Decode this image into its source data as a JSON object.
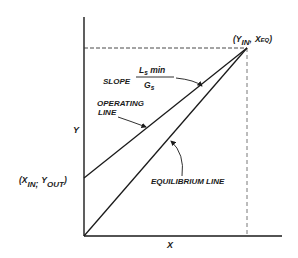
{
  "diagram": {
    "axes": {
      "x_label": "X",
      "y_label": "Y"
    },
    "points": {
      "top": {
        "open": "(Y",
        "sub1": "IN",
        "sep": ",",
        "x": "X",
        "sub2": "EQ",
        "close": ")"
      },
      "left": {
        "open": "(X",
        "sub1": "IN",
        "sep": ";",
        "y": "Y",
        "sub2": "OUT",
        "close": ")"
      }
    },
    "annotations": {
      "slope_prefix": "SLOPE",
      "slope_num_main": "L",
      "slope_num_sub": "s",
      "slope_num_suffix": " min",
      "slope_den_main": "G",
      "slope_den_sub": "s",
      "operating_line_1": "OPERATING",
      "operating_line_2": "LINE",
      "equilibrium_line": "EQUILIBRIUM LINE"
    },
    "colors": {
      "ink": "#1a1a1a",
      "background": "#ffffff"
    }
  }
}
